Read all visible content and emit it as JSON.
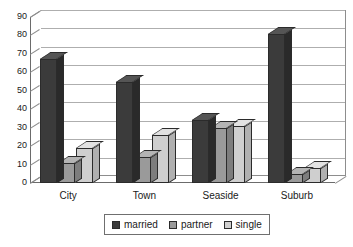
{
  "chart_data": {
    "type": "bar",
    "title": "",
    "subtitle": "",
    "xlabel": "",
    "ylabel": "",
    "categories": [
      "City",
      "Town",
      "Seaside",
      "Suburb"
    ],
    "series": [
      {
        "name": "married",
        "values": [
          67,
          55,
          34,
          81
        ],
        "color": "#3b3b3b"
      },
      {
        "name": "partner",
        "values": [
          11,
          14,
          30,
          5
        ],
        "color": "#9a9a9a"
      },
      {
        "name": "single",
        "values": [
          19,
          26,
          31,
          8
        ],
        "color": "#cfcfcf"
      }
    ],
    "ylim": [
      0,
      90
    ],
    "ytick_step": 10,
    "yticks": [
      0,
      10,
      20,
      30,
      40,
      50,
      60,
      70,
      80,
      90
    ],
    "ytick_labels": [
      "0",
      "10",
      "20",
      "30",
      "40",
      "50",
      "60",
      "70",
      "80",
      "90"
    ],
    "grid": true,
    "grid_axis": "y",
    "legend_position": "bottom",
    "style": "3d-column"
  },
  "legend": {
    "items": [
      {
        "label": "married",
        "color": "#3b3b3b"
      },
      {
        "label": "partner",
        "color": "#9a9a9a"
      },
      {
        "label": "single",
        "color": "#cfcfcf"
      }
    ]
  }
}
